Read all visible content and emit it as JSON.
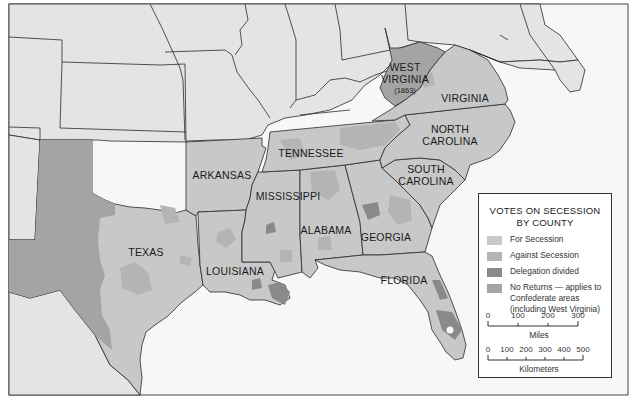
{
  "map": {
    "colors": {
      "non_confederate": "#e4e4e4",
      "water": "#f7f7f7",
      "for_secession": "#c8c8c8",
      "against_secession": "#b4b4b4",
      "delegation_divided": "#8a8a8a",
      "no_returns": "#a4a4a4",
      "border": "#2a2a2a"
    },
    "states": [
      {
        "id": "west-virginia",
        "label": "WEST",
        "label2": "VIRGINIA",
        "sub": "(1863)"
      },
      {
        "id": "virginia",
        "label": "VIRGINIA"
      },
      {
        "id": "north-carolina",
        "label": "NORTH",
        "label2": "CAROLINA"
      },
      {
        "id": "tennessee",
        "label": "TENNESSEE"
      },
      {
        "id": "south-carolina",
        "label": "SOUTH",
        "label2": "CAROLINA"
      },
      {
        "id": "arkansas",
        "label": "ARKANSAS"
      },
      {
        "id": "mississippi",
        "label": "MISSISSIPPI"
      },
      {
        "id": "alabama",
        "label": "ALABAMA"
      },
      {
        "id": "georgia",
        "label": "GEORGIA"
      },
      {
        "id": "texas",
        "label": "TEXAS"
      },
      {
        "id": "louisiana",
        "label": "LOUISIANA"
      },
      {
        "id": "florida",
        "label": "FLORIDA"
      }
    ]
  },
  "legend": {
    "title_line1": "VOTES ON SECESSION",
    "title_line2": "BY COUNTY",
    "items": [
      {
        "label": "For Secession",
        "color": "#c8c8c8"
      },
      {
        "label": "Against Secession",
        "color": "#b4b4b4"
      },
      {
        "label": "Delegation divided",
        "color": "#8a8a8a"
      },
      {
        "label_line1": "No Returns — applies to",
        "label_line2": "Confederate areas",
        "label_line3": "(including West Virginia)",
        "color": "#a4a4a4"
      }
    ],
    "scale_miles": {
      "ticks": [
        "0",
        "100",
        "200",
        "300"
      ],
      "unit": "Miles"
    },
    "scale_km": {
      "ticks": [
        "0",
        "100",
        "200",
        "300",
        "400",
        "500"
      ],
      "unit": "Kilometers"
    }
  }
}
